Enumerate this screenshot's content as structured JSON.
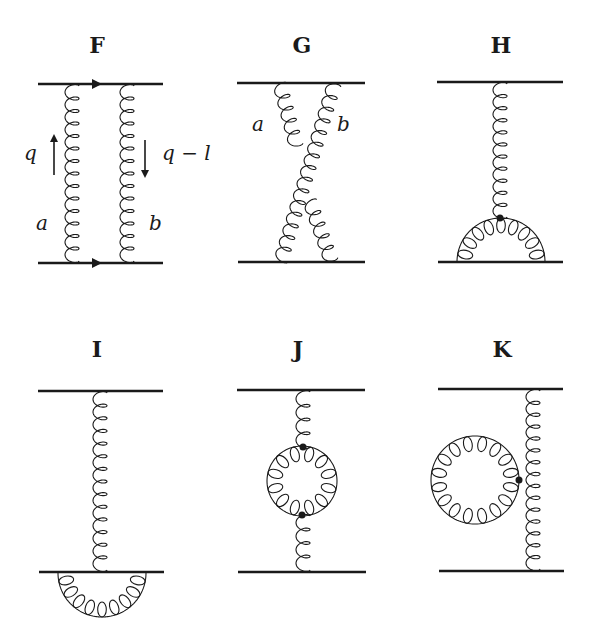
{
  "diagrams": [
    {
      "id": "F",
      "title": "F",
      "labels": {
        "momentum_left": "q",
        "momentum_right": "q − l",
        "gluon_left": "a",
        "gluon_right": "b"
      },
      "description": "ladder: two vertical gluons exchanged between two quark lines with arrows"
    },
    {
      "id": "G",
      "title": "G",
      "labels": {
        "gluon_left": "a",
        "gluon_right": "b"
      },
      "description": "crossed ladder: two crossed gluons"
    },
    {
      "id": "H",
      "title": "H",
      "description": "single gluon with three-gluon vertex attaching to gluon semicircle on bottom line"
    },
    {
      "id": "I",
      "title": "I",
      "description": "single gluon exchange with self-energy gluon semicircle below bottom line"
    },
    {
      "id": "J",
      "title": "J",
      "description": "single gluon exchange with gluon loop (vacuum polarization) in middle"
    },
    {
      "id": "K",
      "title": "K",
      "description": "single gluon exchange with gluon tadpole loop attached via four-gluon vertex"
    }
  ],
  "colors": {
    "ink": "#1a1a1a",
    "background": "#ffffff"
  }
}
